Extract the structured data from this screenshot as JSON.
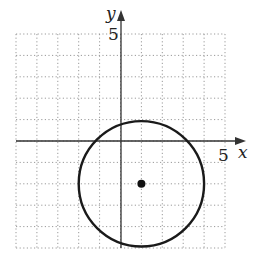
{
  "chart_data": {
    "type": "scatter",
    "title": "",
    "xlabel": "x",
    "ylabel": "y",
    "xlim": [
      -5,
      5
    ],
    "ylim": [
      -5,
      5
    ],
    "grid": true,
    "grid_style": "dotted",
    "tick_labels": {
      "x": "5",
      "y": "5"
    },
    "series": [
      {
        "name": "circle",
        "shape": "circle",
        "center": [
          1,
          -2
        ],
        "radius": 3
      },
      {
        "name": "center-point",
        "points": [
          [
            1,
            -2
          ]
        ]
      }
    ],
    "equation": "(x - 1)^2 + (y + 2)^2 = 9"
  },
  "labels": {
    "x_axis": "x",
    "y_axis": "y",
    "x_tick": "5",
    "y_tick": "5"
  },
  "colors": {
    "grid": "#9a9a9a",
    "axis": "#333333",
    "curve": "#1a1a1a"
  }
}
